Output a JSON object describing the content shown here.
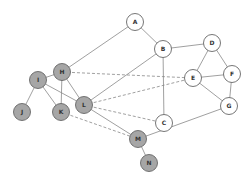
{
  "diagram": {
    "type": "network-graph",
    "colors": {
      "edge": "#888888",
      "white_node_fill": "#ffffff",
      "gray_node_fill": "#a6a6a6",
      "node_stroke": "#666666",
      "label": "#333333"
    },
    "nodes": [
      {
        "id": "A",
        "label": "A",
        "x": 135,
        "y": 22,
        "fill": "white"
      },
      {
        "id": "B",
        "label": "B",
        "x": 163,
        "y": 49,
        "fill": "white"
      },
      {
        "id": "C",
        "label": "C",
        "x": 164,
        "y": 123,
        "fill": "white"
      },
      {
        "id": "D",
        "label": "D",
        "x": 212,
        "y": 43,
        "fill": "white"
      },
      {
        "id": "E",
        "label": "E",
        "x": 193,
        "y": 78,
        "fill": "white"
      },
      {
        "id": "F",
        "label": "F",
        "x": 232,
        "y": 74,
        "fill": "white"
      },
      {
        "id": "G",
        "label": "G",
        "x": 229,
        "y": 106,
        "fill": "white"
      },
      {
        "id": "H",
        "label": "H",
        "x": 62,
        "y": 72,
        "fill": "gray"
      },
      {
        "id": "I",
        "label": "I",
        "x": 38,
        "y": 80,
        "fill": "gray"
      },
      {
        "id": "J",
        "label": "J",
        "x": 22,
        "y": 112,
        "fill": "gray"
      },
      {
        "id": "K",
        "label": "K",
        "x": 61,
        "y": 112,
        "fill": "gray"
      },
      {
        "id": "L",
        "label": "L",
        "x": 84,
        "y": 105,
        "fill": "gray"
      },
      {
        "id": "M",
        "label": "M",
        "x": 138,
        "y": 139,
        "fill": "gray"
      },
      {
        "id": "N",
        "label": "N",
        "x": 149,
        "y": 163,
        "fill": "gray"
      }
    ],
    "edges": [
      {
        "from": "A",
        "to": "H",
        "style": "solid"
      },
      {
        "from": "A",
        "to": "B",
        "style": "solid"
      },
      {
        "from": "B",
        "to": "D",
        "style": "solid"
      },
      {
        "from": "B",
        "to": "C",
        "style": "solid"
      },
      {
        "from": "B",
        "to": "L",
        "style": "solid"
      },
      {
        "from": "D",
        "to": "E",
        "style": "solid"
      },
      {
        "from": "D",
        "to": "F",
        "style": "solid"
      },
      {
        "from": "E",
        "to": "F",
        "style": "solid"
      },
      {
        "from": "E",
        "to": "G",
        "style": "solid"
      },
      {
        "from": "F",
        "to": "G",
        "style": "solid"
      },
      {
        "from": "G",
        "to": "M",
        "style": "solid"
      },
      {
        "from": "H",
        "to": "E",
        "style": "dashed"
      },
      {
        "from": "H",
        "to": "I",
        "style": "solid"
      },
      {
        "from": "H",
        "to": "K",
        "style": "solid"
      },
      {
        "from": "H",
        "to": "L",
        "style": "solid"
      },
      {
        "from": "I",
        "to": "J",
        "style": "solid"
      },
      {
        "from": "I",
        "to": "K",
        "style": "solid"
      },
      {
        "from": "I",
        "to": "L",
        "style": "solid"
      },
      {
        "from": "L",
        "to": "C",
        "style": "dashed"
      },
      {
        "from": "L",
        "to": "E",
        "style": "dashed"
      },
      {
        "from": "L",
        "to": "M",
        "style": "solid"
      },
      {
        "from": "K",
        "to": "M",
        "style": "dashed"
      },
      {
        "from": "M",
        "to": "N",
        "style": "solid"
      }
    ]
  }
}
